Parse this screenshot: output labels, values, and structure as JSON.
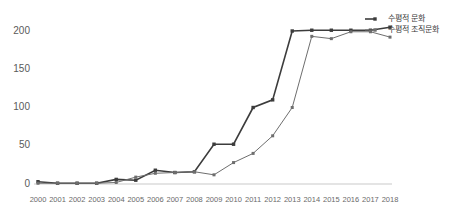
{
  "chart_data": {
    "type": "line",
    "title": "",
    "subtitle": "",
    "xlabel": "",
    "ylabel": "",
    "grid": false,
    "legend_position": "top-right",
    "categories": [
      "2000",
      "2001",
      "2002",
      "2003",
      "2004",
      "2005",
      "2006",
      "2007",
      "2008",
      "2009",
      "2010",
      "2011",
      "2012",
      "2013",
      "2014",
      "2015",
      "2016",
      "2017",
      "2018"
    ],
    "xlim": [
      2000,
      2018
    ],
    "ylim": [
      0,
      210
    ],
    "yticks": [
      0,
      50,
      100,
      150,
      200
    ],
    "ytick_labels": [
      "0",
      "50",
      "100",
      "150",
      "200"
    ],
    "series": [
      {
        "name": "수평적 문화",
        "color": "#3c3c3c",
        "line_width": 1.6,
        "marker": "square",
        "values": [
          3,
          1,
          1,
          1,
          6,
          5,
          18,
          15,
          16,
          52,
          52,
          100,
          110,
          200,
          201,
          201,
          201,
          201,
          205
        ]
      },
      {
        "name": "수평적 조직문화",
        "color": "#6e6e6e",
        "line_width": 1.0,
        "marker": "square",
        "values": [
          1,
          1,
          1,
          1,
          2,
          9,
          14,
          15,
          16,
          12,
          28,
          40,
          63,
          100,
          193,
          190,
          199,
          199,
          192
        ]
      }
    ]
  },
  "legend": {
    "entries": [
      {
        "label": "수평적 문화"
      },
      {
        "label": "수평적 조직문화"
      }
    ]
  }
}
